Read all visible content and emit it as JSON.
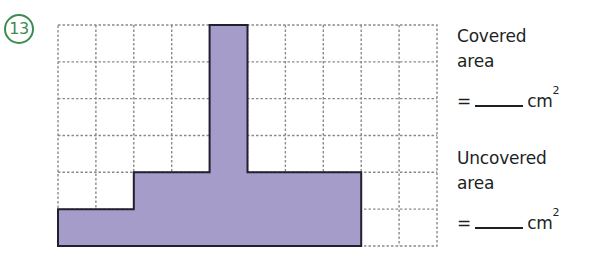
{
  "question": {
    "number": "13",
    "number_badge_color": "#3f8a4f"
  },
  "prompts": [
    {
      "id": "covered",
      "label": "Covered\narea",
      "equals": "=",
      "blank": "",
      "unit": "cm",
      "unit_exponent": "2"
    },
    {
      "id": "uncovered",
      "label": "Uncovered\narea",
      "equals": "=",
      "blank": "",
      "unit": "cm",
      "unit_exponent": "2"
    }
  ],
  "figure": {
    "grid": {
      "columns": 10,
      "rows": 6,
      "cell_width": 37.9,
      "cell_height": 36.83,
      "line_color": "#8a8a8a",
      "line_style": "dashed",
      "border_color": "#8a8a8a"
    },
    "shape": {
      "fill_color": "#a69cc9",
      "stroke_color": "#221f2e",
      "stroke_width": 2,
      "description": "T-shaped covered region on a 10 by 6 centimetre grid",
      "covered_cells": [
        {
          "col": 4,
          "row": 0
        },
        {
          "col": 4,
          "row": 1
        },
        {
          "col": 4,
          "row": 2
        },
        {
          "col": 4,
          "row": 3
        },
        {
          "col": 2,
          "row": 4
        },
        {
          "col": 3,
          "row": 4
        },
        {
          "col": 4,
          "row": 4
        },
        {
          "col": 5,
          "row": 4
        },
        {
          "col": 6,
          "row": 4
        },
        {
          "col": 7,
          "row": 4
        },
        {
          "col": 0,
          "row": 5
        },
        {
          "col": 1,
          "row": 5
        },
        {
          "col": 2,
          "row": 5
        },
        {
          "col": 3,
          "row": 5
        },
        {
          "col": 4,
          "row": 5
        },
        {
          "col": 5,
          "row": 5
        },
        {
          "col": 6,
          "row": 5
        },
        {
          "col": 7,
          "row": 5
        }
      ],
      "outline_points": "4,0 5,0 5,4 8,4 8,6 0,6 0,5 2,5 2,4 4,4"
    }
  }
}
